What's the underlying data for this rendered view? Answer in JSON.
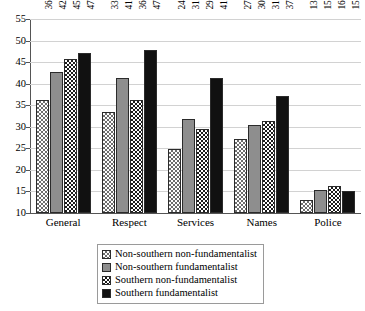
{
  "chart_data": {
    "type": "bar",
    "title": "",
    "subtitle": "",
    "xlabel": "",
    "ylabel": "",
    "categories": [
      "General",
      "Respect",
      "Services",
      "Names",
      "Police"
    ],
    "series": [
      {
        "name": "Non-southern non-fundamentalist",
        "pattern": "light-checker",
        "color": "#ffffff",
        "values": [
          36.1,
          33.5,
          24.8,
          27.1,
          13.0
        ],
        "labels": [
          "36.1",
          "33.5",
          "24.8",
          "27.1",
          "13.0"
        ]
      },
      {
        "name": "Non-southern fundamentalist",
        "pattern": "solid-gray",
        "color": "#8e8e8e",
        "values": [
          42.8,
          41.4,
          31.8,
          30.5,
          15.3
        ],
        "labels": [
          "42.8",
          "41.4",
          "31.8",
          "30.5",
          "15.3"
        ]
      },
      {
        "name": "Southern non-fundamentalist",
        "pattern": "dark-checker",
        "color": "#1c1c1c",
        "values": [
          45.7,
          36.3,
          29.5,
          31.3,
          16.2
        ],
        "labels": [
          "45.7",
          "36.3",
          "29.5",
          "31.3",
          "16.2"
        ]
      },
      {
        "name": "Southern fundamentalist",
        "pattern": "solid-black",
        "color": "#111111",
        "values": [
          47.1,
          47.7,
          41.3,
          37.2,
          15.2
        ],
        "labels": [
          "47.1",
          "47.7",
          "41.3",
          "37.2",
          "15.2"
        ]
      }
    ],
    "ylim": [
      10,
      55
    ],
    "ytick_step": 5,
    "yticks": [
      "55",
      "50",
      "45",
      "40",
      "35",
      "30",
      "25",
      "20",
      "15",
      "10"
    ],
    "grid": true,
    "legend_position": "bottom-center",
    "legend_entries": [
      "Non-southern non-fundamentalist",
      "Non-southern fundamentalist",
      "Southern non-fundamentalist",
      "Southern fundamentalist"
    ]
  }
}
